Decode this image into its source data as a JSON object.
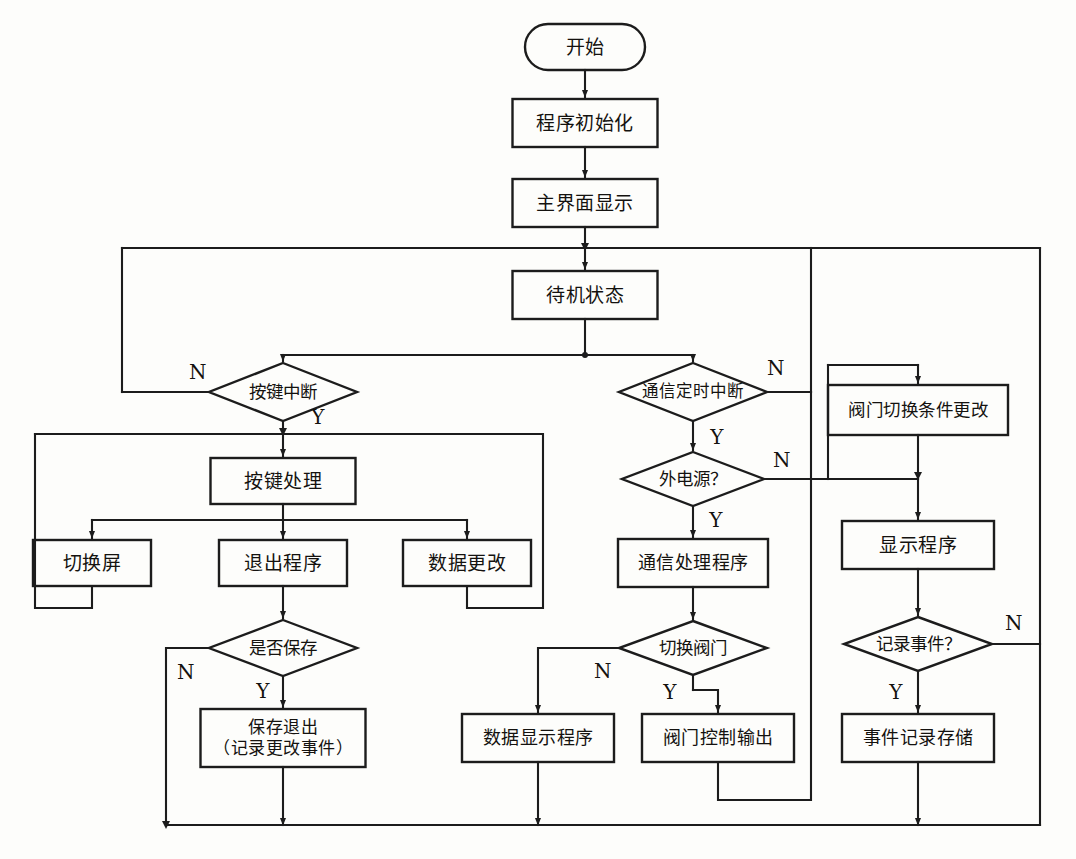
{
  "diagram": {
    "type": "flowchart",
    "orientation": "top-down",
    "language": "zh-CN",
    "line_color": "#1c1c1c",
    "fill_color": "#fdfdfb",
    "background": "#fdfdfb"
  },
  "nodes": [
    {
      "id": "start",
      "shape": "terminator",
      "label": "开始",
      "x": 585,
      "y": 47,
      "w": 120,
      "h": 46
    },
    {
      "id": "init",
      "shape": "process",
      "label": "程序初始化",
      "x": 585,
      "y": 123,
      "w": 145,
      "h": 48
    },
    {
      "id": "mainui",
      "shape": "process",
      "label": "主界面显示",
      "x": 585,
      "y": 203,
      "w": 145,
      "h": 48
    },
    {
      "id": "standby",
      "shape": "process",
      "label": "待机状态",
      "x": 585,
      "y": 295,
      "w": 145,
      "h": 48
    },
    {
      "id": "keyint",
      "shape": "decision",
      "label": "按键中断",
      "x": 283,
      "y": 392,
      "w": 148,
      "h": 58
    },
    {
      "id": "commint",
      "shape": "decision",
      "label": "通信定时中断",
      "x": 693,
      "y": 392,
      "w": 148,
      "h": 58
    },
    {
      "id": "keyproc",
      "shape": "process",
      "label": "按键处理",
      "x": 283,
      "y": 481,
      "w": 145,
      "h": 46
    },
    {
      "id": "switchscreen",
      "shape": "process",
      "label": "切换屏",
      "x": 92,
      "y": 563,
      "w": 118,
      "h": 46
    },
    {
      "id": "exitprog",
      "shape": "process",
      "label": "退出程序",
      "x": 283,
      "y": 563,
      "w": 128,
      "h": 46
    },
    {
      "id": "datachange",
      "shape": "process",
      "label": "数据更改",
      "x": 467,
      "y": 563,
      "w": 128,
      "h": 46
    },
    {
      "id": "savequery",
      "shape": "decision",
      "label": "是否保存",
      "x": 283,
      "y": 648,
      "w": 148,
      "h": 56
    },
    {
      "id": "saveexit",
      "shape": "process",
      "label": "保存退出\n（记录更改事件）",
      "x": 283,
      "y": 738,
      "w": 165,
      "h": 58
    },
    {
      "id": "extpower",
      "shape": "decision",
      "label": "外电源？",
      "x": 693,
      "y": 479,
      "w": 142,
      "h": 54
    },
    {
      "id": "commproc",
      "shape": "process",
      "label": "通信处理程序",
      "x": 693,
      "y": 563,
      "w": 150,
      "h": 48
    },
    {
      "id": "switchvalve",
      "shape": "decision",
      "label": "切换阀门",
      "x": 693,
      "y": 648,
      "w": 148,
      "h": 54
    },
    {
      "id": "datadisplay",
      "shape": "process",
      "label": "数据显示程序",
      "x": 538,
      "y": 738,
      "w": 152,
      "h": 48
    },
    {
      "id": "valveout",
      "shape": "process",
      "label": "阀门控制输出",
      "x": 718,
      "y": 738,
      "w": 152,
      "h": 48
    },
    {
      "id": "valvecond",
      "shape": "process",
      "label": "阀门切换条件更改",
      "x": 918,
      "y": 410,
      "w": 180,
      "h": 50
    },
    {
      "id": "dispprog",
      "shape": "process",
      "label": "显示程序",
      "x": 918,
      "y": 545,
      "w": 152,
      "h": 48
    },
    {
      "id": "recordquery",
      "shape": "decision",
      "label": "记录事件？",
      "x": 918,
      "y": 644,
      "w": 148,
      "h": 54
    },
    {
      "id": "recordstore",
      "shape": "process",
      "label": "事件记录存储",
      "x": 918,
      "y": 738,
      "w": 152,
      "h": 48
    }
  ],
  "branch_labels": [
    {
      "id": "keyint-n",
      "text": "N",
      "x": 198,
      "y": 373
    },
    {
      "id": "keyint-y",
      "text": "Y",
      "x": 318,
      "y": 418
    },
    {
      "id": "commint-n",
      "text": "N",
      "x": 776,
      "y": 369
    },
    {
      "id": "commint-y",
      "text": "Y",
      "x": 717,
      "y": 438
    },
    {
      "id": "extpower-n",
      "text": "N",
      "x": 782,
      "y": 461
    },
    {
      "id": "extpower-y",
      "text": "Y",
      "x": 716,
      "y": 521
    },
    {
      "id": "savequery-n",
      "text": "N",
      "x": 186,
      "y": 673
    },
    {
      "id": "savequery-y",
      "text": "Y",
      "x": 263,
      "y": 692
    },
    {
      "id": "switchvalve-n",
      "text": "N",
      "x": 603,
      "y": 672
    },
    {
      "id": "switchvalve-y",
      "text": "Y",
      "x": 670,
      "y": 693
    },
    {
      "id": "recordquery-n",
      "text": "N",
      "x": 1014,
      "y": 624
    },
    {
      "id": "recordquery-y",
      "text": "Y",
      "x": 896,
      "y": 693
    }
  ],
  "edges": [
    {
      "from": "start",
      "to": "init",
      "label": ""
    },
    {
      "from": "init",
      "to": "mainui",
      "label": ""
    },
    {
      "from": "mainui",
      "to": "standby",
      "label": ""
    },
    {
      "from": "standby",
      "to": "keyint",
      "label": ""
    },
    {
      "from": "standby",
      "to": "commint",
      "label": ""
    },
    {
      "from": "keyint",
      "to": "loop-left",
      "label": "N"
    },
    {
      "from": "keyint",
      "to": "keyproc",
      "label": "Y"
    },
    {
      "from": "keyproc",
      "to": "switchscreen",
      "label": ""
    },
    {
      "from": "keyproc",
      "to": "exitprog",
      "label": ""
    },
    {
      "from": "keyproc",
      "to": "datachange",
      "label": ""
    },
    {
      "from": "exitprog",
      "to": "savequery",
      "label": ""
    },
    {
      "from": "savequery",
      "to": "bottom-return",
      "label": "N"
    },
    {
      "from": "savequery",
      "to": "saveexit",
      "label": "Y"
    },
    {
      "from": "saveexit",
      "to": "bottom-return",
      "label": ""
    },
    {
      "from": "commint",
      "to": "loop-right",
      "label": "N"
    },
    {
      "from": "commint",
      "to": "extpower",
      "label": "Y"
    },
    {
      "from": "extpower",
      "to": "valvecond",
      "label": "N"
    },
    {
      "from": "extpower",
      "to": "commproc",
      "label": "Y"
    },
    {
      "from": "commproc",
      "to": "switchvalve",
      "label": ""
    },
    {
      "from": "switchvalve",
      "to": "datadisplay",
      "label": "N"
    },
    {
      "from": "switchvalve",
      "to": "valveout",
      "label": "Y"
    },
    {
      "from": "datadisplay",
      "to": "bottom-return",
      "label": ""
    },
    {
      "from": "valveout",
      "to": "bottom-return",
      "label": ""
    },
    {
      "from": "valvecond",
      "to": "dispprog",
      "label": ""
    },
    {
      "from": "dispprog",
      "to": "recordquery",
      "label": ""
    },
    {
      "from": "recordquery",
      "to": "right-return",
      "label": "N"
    },
    {
      "from": "recordquery",
      "to": "recordstore",
      "label": "Y"
    },
    {
      "from": "recordstore",
      "to": "bottom-return",
      "label": ""
    }
  ]
}
